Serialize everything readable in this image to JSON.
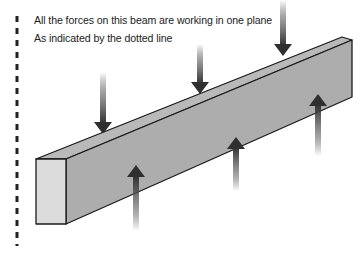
{
  "caption": {
    "line1": "All the forces on this beam are working in one plane",
    "line2": "As indicated by the dotted line"
  },
  "colors": {
    "beam_top": "#b9b9b9",
    "beam_side": "#adadad",
    "beam_end": "#dcdcdc",
    "outline": "#1a1a1a",
    "arrow": "#3a3a3a",
    "dotted_line": "#222222"
  },
  "diagram": {
    "beam": "rectangular beam in perspective",
    "down_forces": 3,
    "up_forces": 3,
    "plane_indicator": "dotted vertical line"
  }
}
